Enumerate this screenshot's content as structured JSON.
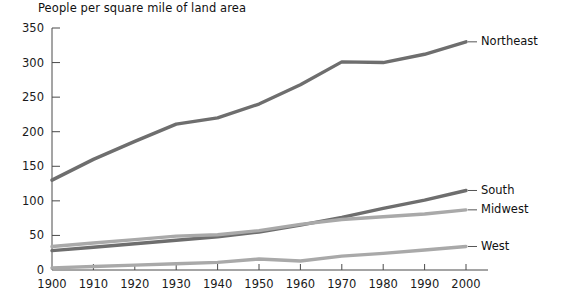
{
  "chart_data": {
    "type": "line",
    "title": "People per square mile of land area",
    "xlabel": "",
    "ylabel": "",
    "xlim": [
      1900,
      2000
    ],
    "ylim": [
      0,
      350
    ],
    "grid": false,
    "legend_position": "right-inline-labels",
    "x": [
      1900,
      1910,
      1920,
      1930,
      1940,
      1950,
      1960,
      1970,
      1980,
      1990,
      2000
    ],
    "xtick_labels": [
      "1900",
      "1910",
      "1920",
      "1930",
      "1940",
      "1950",
      "1960",
      "1970",
      "1980",
      "1990",
      "2000"
    ],
    "ytick_labels": [
      "0",
      "50",
      "100",
      "150",
      "200",
      "250",
      "300",
      "350"
    ],
    "ytick_values": [
      0,
      50,
      100,
      150,
      200,
      250,
      300,
      350
    ],
    "series": [
      {
        "name": "Northeast",
        "color": "#6e6e6e",
        "values": [
          130,
          160,
          186,
          211,
          220,
          240,
          268,
          301,
          300,
          312,
          330
        ]
      },
      {
        "name": "South",
        "color": "#6e6e6e",
        "values": [
          28,
          33,
          38,
          43,
          48,
          55,
          65,
          76,
          89,
          101,
          115
        ]
      },
      {
        "name": "Midwest",
        "color": "#a9a9a9",
        "values": [
          34,
          39,
          44,
          49,
          51,
          57,
          66,
          73,
          77,
          81,
          87
        ]
      },
      {
        "name": "West",
        "color": "#a9a9a9",
        "values": [
          3,
          5,
          7,
          9,
          11,
          16,
          13,
          20,
          24,
          29,
          34
        ]
      }
    ]
  }
}
